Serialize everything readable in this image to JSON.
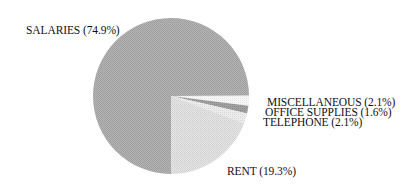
{
  "chart_data": {
    "type": "pie",
    "title": "",
    "categories": [
      "MISCELLANEOUS",
      "OFFICE SUPPLIES",
      "TELEPHONE",
      "RENT",
      "SALARIES"
    ],
    "values": [
      2.1,
      1.6,
      2.1,
      19.3,
      74.9
    ],
    "unit": "%",
    "labels": [
      "MISCELLANEOUS (2.1%)",
      "OFFICE SUPPLIES (1.6%)",
      "TELEPHONE (2.1%)",
      "RENT (19.3%)",
      "SALARIES (74.9%)"
    ],
    "colors": [
      "#f2f2f2",
      "#9a9a9a",
      "#e2e2e2",
      "#dcdcdc",
      "#aaaaaa"
    ],
    "legend": "none (direct slice labels)",
    "start_angle_deg": -0.4,
    "direction": "clockwise"
  },
  "labels": {
    "salaries": "SALARIES (74.9%)",
    "miscellaneous": "MISCELLANEOUS (2.1%)",
    "office_supplies": "OFFICE SUPPLIES (1.6%)",
    "telephone": "TELEPHONE (2.1%)",
    "rent": "RENT (19.3%)"
  }
}
